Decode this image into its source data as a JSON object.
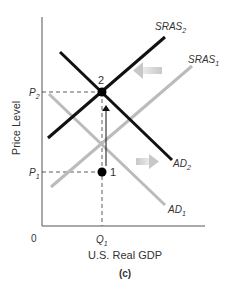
{
  "diagram": {
    "panel_label": "(c)",
    "x_axis_label": "U.S. Real GDP",
    "y_axis_label": "Price Level",
    "origin_label": "0",
    "x_tick_label": {
      "main": "Q",
      "sub": "1"
    },
    "y_tick_labels": [
      {
        "main": "P",
        "sub": "2"
      },
      {
        "main": "P",
        "sub": "1"
      }
    ],
    "curves": [
      {
        "name": "SRAS",
        "sub": "2",
        "color": "#111111"
      },
      {
        "name": "SRAS",
        "sub": "1",
        "color": "#bbbbbb"
      },
      {
        "name": "AD",
        "sub": "2",
        "color": "#111111"
      },
      {
        "name": "AD",
        "sub": "1",
        "color": "#bbbbbb"
      }
    ],
    "points": [
      {
        "label": "1"
      },
      {
        "label": "2"
      }
    ],
    "colors": {
      "dark_curve": "#111111",
      "light_curve": "#bbbbbb",
      "shift_arrow": "#c8c8c8",
      "axis": "#555555"
    }
  }
}
